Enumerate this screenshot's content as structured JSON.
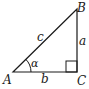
{
  "diagram": {
    "type": "right-triangle",
    "vertices": {
      "A": "A",
      "B": "B",
      "C": "C"
    },
    "sides": {
      "a": "a",
      "b": "b",
      "c": "c"
    },
    "angle": "α",
    "right_angle_at": "C",
    "stroke_color": "#1a1a1a"
  }
}
